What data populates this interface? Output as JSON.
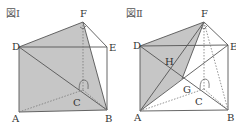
{
  "figures": [
    {
      "title": "図Ⅰ",
      "points": {
        "A": "A",
        "B": "B",
        "C": "C",
        "D": "D",
        "E": "E",
        "F": "F"
      }
    },
    {
      "title": "図Ⅱ",
      "points": {
        "A": "A",
        "B": "B",
        "C": "C",
        "D": "D",
        "E": "E",
        "F": "F",
        "G": "G",
        "H": "H"
      }
    }
  ],
  "colors": {
    "shade": "#c4c4c4",
    "line": "#555555",
    "dotted": "#888888"
  }
}
